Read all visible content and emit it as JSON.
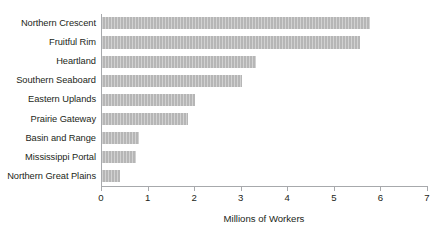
{
  "chart_data": {
    "type": "bar",
    "orientation": "horizontal",
    "title": "",
    "xlabel": "Millions of Workers",
    "ylabel": "",
    "xlim": [
      0,
      7
    ],
    "xticks": [
      "0",
      "1",
      "2",
      "3",
      "4",
      "5",
      "6",
      "7"
    ],
    "grid": false,
    "legend": false,
    "categories": [
      "Northern Crescent",
      "Fruitful Rim",
      "Heartland",
      "Southern Seaboard",
      "Eastern Uplands",
      "Prairie Gateway",
      "Basin and Range",
      "Mississippi Portal",
      "Northern Great Plains"
    ],
    "values": [
      5.75,
      5.55,
      3.3,
      3.0,
      2.0,
      1.85,
      0.8,
      0.72,
      0.38
    ],
    "bar_color": "#b6b6b6",
    "axis_color": "#a7a9ac",
    "text_color": "#231f20",
    "background_color": "#ffffff"
  }
}
